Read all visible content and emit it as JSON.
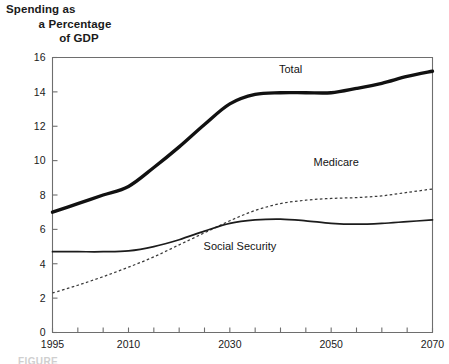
{
  "figure": {
    "title_lines": [
      "Spending as",
      "a Percentage",
      "of GDP"
    ],
    "footnote": "FIGURE",
    "colors": {
      "total": "#111111",
      "social_security": "#1c1c1c",
      "medicare": "#3a3a3a",
      "axis": "#6e6e6e",
      "background": "#ffffff"
    }
  },
  "chart_data": {
    "type": "line",
    "title": "Spending as a Percentage of GDP",
    "xlabel": "",
    "ylabel": "Spending as a Percentage of GDP",
    "xlim": [
      1995,
      2070
    ],
    "ylim": [
      0,
      16
    ],
    "ytick_labels": [
      "0",
      "2",
      "4",
      "6",
      "8",
      "10",
      "12",
      "14",
      "16"
    ],
    "yticks": [
      0,
      2,
      4,
      6,
      8,
      10,
      12,
      14,
      16
    ],
    "xtick_labels": [
      "1995",
      "2010",
      "2030",
      "2050",
      "2070"
    ],
    "xticks_labeled": [
      1995,
      2010,
      2030,
      2050,
      2070
    ],
    "xticks_minor": [
      2000,
      2005,
      2015,
      2020,
      2025,
      2035,
      2040,
      2045,
      2055,
      2060,
      2065
    ],
    "grid": false,
    "legend_position": "inline-labels",
    "x": [
      1995,
      2000,
      2005,
      2010,
      2015,
      2020,
      2025,
      2030,
      2035,
      2040,
      2045,
      2050,
      2055,
      2060,
      2065,
      2070
    ],
    "series": [
      {
        "name": "Total",
        "label": "Total",
        "label_x": 2042,
        "label_y": 15.1,
        "style": "thick-solid",
        "values": [
          7.0,
          7.5,
          8.0,
          8.5,
          9.6,
          10.8,
          12.1,
          13.3,
          13.85,
          13.95,
          13.95,
          13.95,
          14.2,
          14.5,
          14.9,
          15.2
        ]
      },
      {
        "name": "Medicare",
        "label": "Medicare",
        "label_x": 2051,
        "label_y": 9.7,
        "style": "dotted",
        "values": [
          2.3,
          2.75,
          3.25,
          3.8,
          4.4,
          5.1,
          5.8,
          6.5,
          7.1,
          7.5,
          7.7,
          7.8,
          7.85,
          7.95,
          8.15,
          8.35
        ]
      },
      {
        "name": "Social Security",
        "label": "Social Security",
        "label_x": 2032,
        "label_y": 4.8,
        "style": "thin-solid",
        "values": [
          4.7,
          4.7,
          4.7,
          4.75,
          5.0,
          5.4,
          5.9,
          6.35,
          6.55,
          6.6,
          6.5,
          6.35,
          6.3,
          6.35,
          6.45,
          6.55
        ]
      }
    ]
  }
}
